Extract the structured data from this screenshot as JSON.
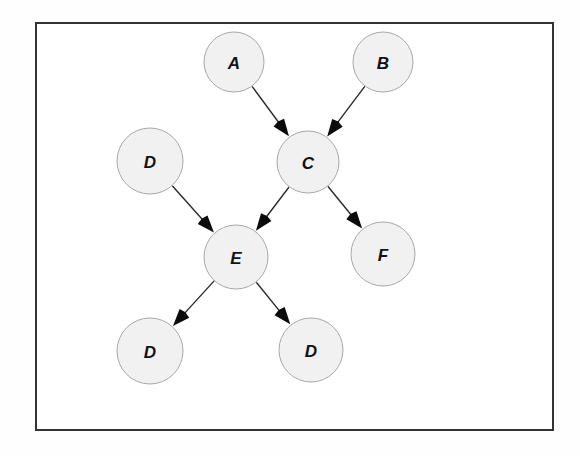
{
  "figure": {
    "type": "directed-graph",
    "background_color": "#fefefe",
    "frame": {
      "name": "figure-border",
      "x": 35,
      "y": 22,
      "width": 519,
      "height": 409,
      "stroke_color": "#333333",
      "stroke_width": 2,
      "fill_color": "#ffffff"
    },
    "node_style": {
      "fill_color": "#f1f1f1",
      "stroke_color": "#a8a8a8",
      "stroke_width": 1,
      "label_color": "#121212"
    },
    "edge_style": {
      "stroke_color": "#2b2b2b",
      "stroke_width": 1.4,
      "arrowhead_color": "#0a0a0a",
      "arrowhead_length": 17,
      "arrowhead_width": 13
    },
    "nodes": [
      {
        "id": "A",
        "label": "A",
        "cx": 234,
        "cy": 62,
        "r": 30
      },
      {
        "id": "B",
        "label": "B",
        "cx": 383,
        "cy": 62,
        "r": 30
      },
      {
        "id": "C",
        "label": "C",
        "cx": 308,
        "cy": 162,
        "r": 31
      },
      {
        "id": "D1",
        "label": "D",
        "cx": 150,
        "cy": 161,
        "r": 33
      },
      {
        "id": "E",
        "label": "E",
        "cx": 236,
        "cy": 257,
        "r": 32
      },
      {
        "id": "F",
        "label": "F",
        "cx": 383,
        "cy": 254,
        "r": 32
      },
      {
        "id": "D2",
        "label": "D",
        "cx": 150,
        "cy": 351,
        "r": 33
      },
      {
        "id": "D3",
        "label": "D",
        "cx": 311,
        "cy": 350,
        "r": 32
      }
    ],
    "edges": [
      {
        "from": "A",
        "to": "C",
        "label": ""
      },
      {
        "from": "B",
        "to": "C",
        "label": ""
      },
      {
        "from": "D1",
        "to": "E",
        "label": ""
      },
      {
        "from": "C",
        "to": "E",
        "label": ""
      },
      {
        "from": "C",
        "to": "F",
        "label": ""
      },
      {
        "from": "E",
        "to": "D2",
        "label": ""
      },
      {
        "from": "E",
        "to": "D3",
        "label": ""
      }
    ]
  }
}
